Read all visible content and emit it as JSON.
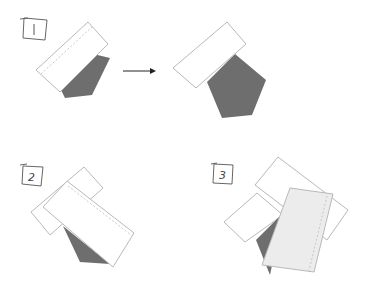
{
  "diagram": {
    "steps": [
      {
        "label": "1"
      },
      {
        "label": "2"
      },
      {
        "label": "3"
      }
    ],
    "arrow": {
      "direction": "right"
    },
    "colors": {
      "paper_fill": "#ffffff",
      "paper_stroke": "#b9b9b9",
      "paper_light_fill": "#ececec",
      "shape_fill": "#6e6e6e",
      "label_stroke": "#555555",
      "arrow_color": "#222222"
    }
  }
}
